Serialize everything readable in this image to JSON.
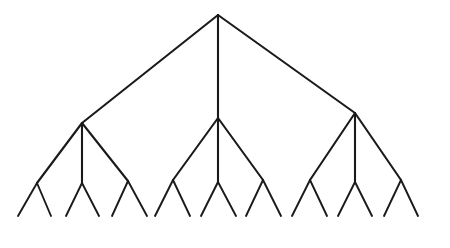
{
  "figure": {
    "kind": "tree-diagram",
    "background_color": "#ffffff",
    "line_color": "#1a1a1a",
    "line_width": 2.1,
    "leaf_line_width": 1.9,
    "canvas": {
      "width": 450,
      "height": 248
    }
  },
  "chart_data": {
    "type": "diagram",
    "subtype": "tree",
    "title": "",
    "xlabel": "",
    "ylabel": "",
    "grid": false,
    "legend": null,
    "depth": 4,
    "branching_pattern": [
      3,
      3,
      2
    ],
    "counts": {
      "root_nodes": 1,
      "level2_nodes": 3,
      "level3_nodes": 9,
      "leaf_endpoints": 18,
      "total_edges": 30
    },
    "levels": [
      {
        "level": 0,
        "name": "root",
        "y": 15,
        "node_count": 1
      },
      {
        "level": 1,
        "name": "branch",
        "y": 118,
        "node_count": 3
      },
      {
        "level": 2,
        "name": "twig",
        "y": 182,
        "node_count": 9
      },
      {
        "level": 3,
        "name": "leaf",
        "y": 215,
        "node_count": 18
      }
    ],
    "nodes": {
      "root": {
        "id": "r",
        "x": 218,
        "y": 15
      },
      "level2": [
        {
          "id": "a",
          "x": 82,
          "y": 123
        },
        {
          "id": "b",
          "x": 218,
          "y": 118
        },
        {
          "id": "c",
          "x": 355,
          "y": 113
        }
      ],
      "level3": [
        {
          "id": "a1",
          "parent": "a",
          "x": 37,
          "y": 183
        },
        {
          "id": "a2",
          "parent": "a",
          "x": 82,
          "y": 183
        },
        {
          "id": "a3",
          "parent": "a",
          "x": 128,
          "y": 181
        },
        {
          "id": "b1",
          "parent": "b",
          "x": 173,
          "y": 180
        },
        {
          "id": "b2",
          "parent": "b",
          "x": 218,
          "y": 182
        },
        {
          "id": "b3",
          "parent": "b",
          "x": 263,
          "y": 180
        },
        {
          "id": "c1",
          "parent": "c",
          "x": 310,
          "y": 180
        },
        {
          "id": "c2",
          "parent": "c",
          "x": 355,
          "y": 182
        },
        {
          "id": "c3",
          "parent": "c",
          "x": 401,
          "y": 180
        }
      ],
      "leaves": [
        {
          "id": "a1L",
          "parent": "a1",
          "x": 18,
          "y": 216
        },
        {
          "id": "a1R",
          "parent": "a1",
          "x": 51,
          "y": 216
        },
        {
          "id": "a2L",
          "parent": "a2",
          "x": 66,
          "y": 216
        },
        {
          "id": "a2R",
          "parent": "a2",
          "x": 99,
          "y": 216
        },
        {
          "id": "a3L",
          "parent": "a3",
          "x": 112,
          "y": 216
        },
        {
          "id": "a3R",
          "parent": "a3",
          "x": 147,
          "y": 216
        },
        {
          "id": "b1L",
          "parent": "b1",
          "x": 155,
          "y": 216
        },
        {
          "id": "b1R",
          "parent": "b1",
          "x": 190,
          "y": 216
        },
        {
          "id": "b2L",
          "parent": "b2",
          "x": 201,
          "y": 216
        },
        {
          "id": "b2R",
          "parent": "b2",
          "x": 236,
          "y": 216
        },
        {
          "id": "b3L",
          "parent": "b3",
          "x": 246,
          "y": 216
        },
        {
          "id": "b3R",
          "parent": "b3",
          "x": 281,
          "y": 216
        },
        {
          "id": "c1L",
          "parent": "c1",
          "x": 292,
          "y": 216
        },
        {
          "id": "c1R",
          "parent": "c1",
          "x": 327,
          "y": 216
        },
        {
          "id": "c2L",
          "parent": "c2",
          "x": 338,
          "y": 216
        },
        {
          "id": "c2R",
          "parent": "c2",
          "x": 372,
          "y": 216
        },
        {
          "id": "c3L",
          "parent": "c3",
          "x": 384,
          "y": 216
        },
        {
          "id": "c3R",
          "parent": "c3",
          "x": 418,
          "y": 216
        }
      ]
    },
    "edges": [
      {
        "from": "r",
        "to": "a"
      },
      {
        "from": "r",
        "to": "b"
      },
      {
        "from": "r",
        "to": "c"
      },
      {
        "from": "a",
        "to": "a1"
      },
      {
        "from": "a",
        "to": "a2"
      },
      {
        "from": "a",
        "to": "a3"
      },
      {
        "from": "b",
        "to": "b1"
      },
      {
        "from": "b",
        "to": "b2"
      },
      {
        "from": "b",
        "to": "b3"
      },
      {
        "from": "c",
        "to": "c1"
      },
      {
        "from": "c",
        "to": "c2"
      },
      {
        "from": "c",
        "to": "c3"
      },
      {
        "from": "a1",
        "to": "a1L"
      },
      {
        "from": "a1",
        "to": "a1R"
      },
      {
        "from": "a2",
        "to": "a2L"
      },
      {
        "from": "a2",
        "to": "a2R"
      },
      {
        "from": "a3",
        "to": "a3L"
      },
      {
        "from": "a3",
        "to": "a3R"
      },
      {
        "from": "b1",
        "to": "b1L"
      },
      {
        "from": "b1",
        "to": "b1R"
      },
      {
        "from": "b2",
        "to": "b2L"
      },
      {
        "from": "b2",
        "to": "b2R"
      },
      {
        "from": "b3",
        "to": "b3L"
      },
      {
        "from": "b3",
        "to": "b3R"
      },
      {
        "from": "c1",
        "to": "c1L"
      },
      {
        "from": "c1",
        "to": "c1R"
      },
      {
        "from": "c2",
        "to": "c2L"
      },
      {
        "from": "c2",
        "to": "c2R"
      },
      {
        "from": "c3",
        "to": "c3L"
      },
      {
        "from": "c3",
        "to": "c3R"
      }
    ]
  }
}
